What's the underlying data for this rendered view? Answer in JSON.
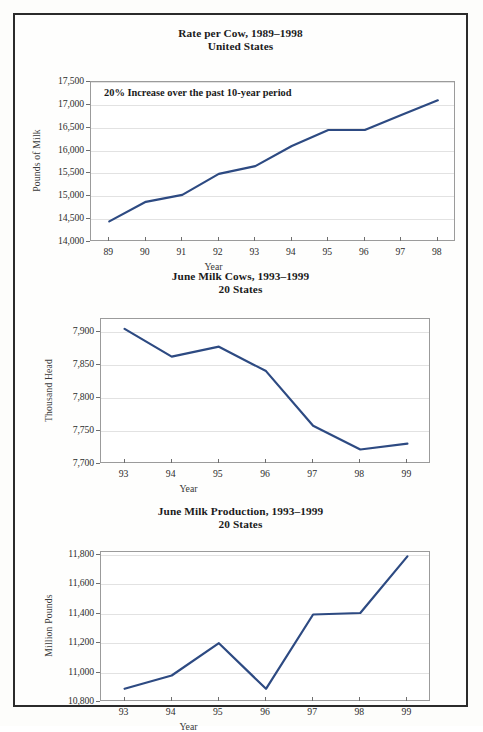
{
  "page": {
    "background_color": "#fefefd",
    "border_color": "#2b2b2b",
    "line_color": "#2d4a82"
  },
  "figures": [
    {
      "id": "rate-per-cow",
      "title_line1": "Rate per Cow, 1989–1998",
      "title_line2": "United States",
      "annotation": "20% Increase over the past 10-year period",
      "xaxis_title": "Year",
      "yaxis_title": "Pounds of Milk"
    },
    {
      "id": "june-milk-cows",
      "title_line1": "June Milk Cows, 1993–1999",
      "title_line2": "20 States",
      "annotation": "",
      "xaxis_title": "Year",
      "yaxis_title": "Thousand Head"
    },
    {
      "id": "june-milk-production",
      "title_line1": "June Milk Production, 1993–1999",
      "title_line2": "20 States",
      "annotation": "",
      "xaxis_title": "Year",
      "yaxis_title": "Million Pounds"
    }
  ],
  "chart_data": [
    {
      "type": "line",
      "title": "Rate per Cow, 1989–1998 — United States",
      "subtitle": "United States",
      "annotation": "20% Increase over the past 10-year period",
      "xlabel": "Year",
      "ylabel": "Pounds of Milk",
      "categories": [
        "89",
        "90",
        "91",
        "92",
        "93",
        "94",
        "95",
        "96",
        "97",
        "98"
      ],
      "values": [
        14450,
        14880,
        15030,
        15490,
        15660,
        16100,
        16450,
        16450,
        16780,
        17100
      ],
      "ylim": [
        14000,
        17500
      ],
      "yticks": [
        14000,
        14500,
        15000,
        15500,
        16000,
        16500,
        17000,
        17500
      ],
      "ytick_labels": [
        "14,000",
        "14,500",
        "15,000",
        "15,500",
        "16,000",
        "16,500",
        "17,000",
        "17,500"
      ],
      "grid": true,
      "legend": "none",
      "line_color": "#2d4a82"
    },
    {
      "type": "line",
      "title": "June Milk Cows, 1993–1999 — 20 States",
      "subtitle": "20 States",
      "xlabel": "Year",
      "ylabel": "Thousand Head",
      "categories": [
        "93",
        "94",
        "95",
        "96",
        "97",
        "98",
        "99"
      ],
      "values": [
        7905,
        7863,
        7878,
        7841,
        7758,
        7722,
        7731
      ],
      "ylim": [
        7700,
        7920
      ],
      "yticks": [
        7700,
        7750,
        7800,
        7850,
        7900
      ],
      "ytick_labels": [
        "7,700",
        "7,750",
        "7,800",
        "7,850",
        "7,900"
      ],
      "grid": true,
      "legend": "none",
      "line_color": "#2d4a82"
    },
    {
      "type": "line",
      "title": "June Milk Production, 1993–1999 — 20 States",
      "subtitle": "20 States",
      "xlabel": "Year",
      "ylabel": "Million Pounds",
      "categories": [
        "93",
        "94",
        "95",
        "96",
        "97",
        "98",
        "99"
      ],
      "values": [
        10890,
        10980,
        11200,
        10890,
        11395,
        11405,
        11790
      ],
      "ylim": [
        10800,
        11820
      ],
      "yticks": [
        10800,
        11000,
        11200,
        11400,
        11600,
        11800
      ],
      "ytick_labels": [
        "10,800",
        "11,000",
        "11,200",
        "11,400",
        "11,600",
        "11,800"
      ],
      "grid": true,
      "legend": "none",
      "line_color": "#2d4a82"
    }
  ]
}
